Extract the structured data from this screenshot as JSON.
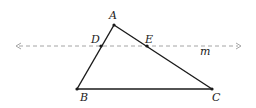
{
  "diagram": {
    "type": "triangle-with-parallel-line",
    "colors": {
      "stroke": "#1a1a1a",
      "dashed": "#9a9a9a",
      "text": "#222222"
    },
    "points": {
      "A": {
        "label": "A",
        "x": 114,
        "y": 25,
        "lx": 109,
        "ly": 19
      },
      "B": {
        "label": "B",
        "x": 77,
        "y": 89,
        "lx": 80,
        "ly": 101
      },
      "C": {
        "label": "C",
        "x": 212,
        "y": 89,
        "lx": 212,
        "ly": 101
      },
      "D": {
        "label": "D",
        "x": 101,
        "y": 46,
        "lx": 91,
        "ly": 43
      },
      "E": {
        "label": "E",
        "x": 147,
        "y": 46,
        "lx": 145,
        "ly": 43
      }
    },
    "line_m": {
      "label": "m",
      "x1": 15,
      "x2": 242,
      "y": 46,
      "lx": 200,
      "ly": 55,
      "style": "dashed",
      "arrows": "both"
    },
    "segments": [
      "AB",
      "BC",
      "CA"
    ]
  }
}
